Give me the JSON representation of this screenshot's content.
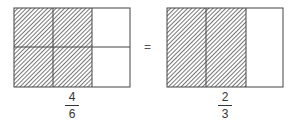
{
  "diagram": {
    "left": {
      "rows": 2,
      "cols": 3,
      "shaded_cols": 2,
      "fraction": {
        "numerator": "4",
        "denominator": "6"
      }
    },
    "operator": "=",
    "right": {
      "rows": 1,
      "cols": 3,
      "shaded_cols": 2,
      "fraction": {
        "numerator": "2",
        "denominator": "3"
      }
    },
    "colors": {
      "stroke": "#444444",
      "hatch": "#555555",
      "fill": "#ffffff"
    }
  }
}
